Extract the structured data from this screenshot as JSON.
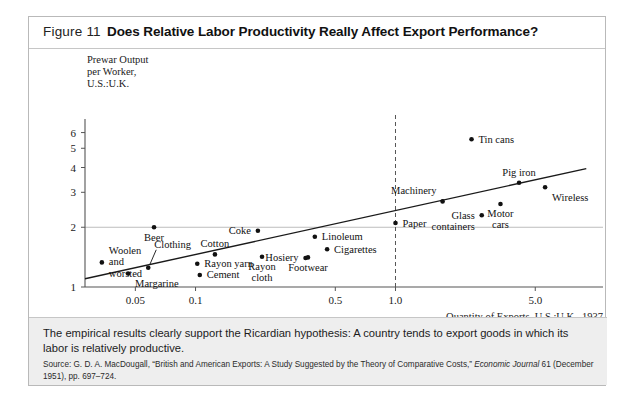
{
  "figure": {
    "number": "Figure 11",
    "title": "Does Relative Labor Productivity Really Affect Export Performance?",
    "caption": "The empirical results clearly support the Ricardian hypothesis: A country tends to export goods in which its labor is relatively productive.",
    "source_prefix": "Source: G. D. A. MacDougall, “British and American Exports: A Study Suggested by the Theory of Comparative Costs,” ",
    "source_italic": "Economic Journal",
    "source_suffix": " 61 (December 1951), pp. 697–724."
  },
  "chart_data": {
    "type": "scatter",
    "title": "Does Relative Labor Productivity Really Affect Export Performance?",
    "xlabel": "Quantity of Exports, U.S.:U.K., 1937",
    "ylabel": "Prewar Output per Worker, U.S.:U.K.",
    "ylabel_lines": [
      "Prewar Output",
      "per Worker,",
      "U.S.:U.K."
    ],
    "xscale": "log",
    "yscale": "log",
    "xticks": [
      "0.05",
      "0.1",
      "0.5",
      "1.0",
      "5.0"
    ],
    "xtick_values": [
      0.05,
      0.1,
      0.5,
      1.0,
      5.0
    ],
    "yticks": [
      "1",
      "2",
      "3",
      "4",
      "5",
      "6"
    ],
    "ytick_values": [
      1,
      2,
      3,
      4,
      5,
      6
    ],
    "xlim": [
      0.028,
      9.5
    ],
    "ylim": [
      1.0,
      6.4
    ],
    "grid": "single horizontal gridline at y=2",
    "gridline_y": 2,
    "reference_line_x": 1.0,
    "reference_line_style": "dashed vertical",
    "trend_line": {
      "x1": 0.028,
      "y1": 1.1,
      "x2": 9.0,
      "y2": 3.95,
      "style": "solid"
    },
    "points": [
      {
        "label": "Woolen and worsted",
        "x": 0.034,
        "y": 1.33,
        "label_lines": [
          "Woolen",
          "and",
          "worsted"
        ],
        "label_pos": "right"
      },
      {
        "label": "Margarine",
        "x": 0.046,
        "y": 1.17,
        "label_lines": [
          "Margarine"
        ],
        "label_pos": "below-right"
      },
      {
        "label": "Beer",
        "x": 0.062,
        "y": 2.0,
        "label_lines": [
          "Beer"
        ],
        "label_pos": "below"
      },
      {
        "label": "Clothing",
        "x": 0.058,
        "y": 1.25,
        "label_lines": [
          "Clothing"
        ],
        "label_pos": "leader-above"
      },
      {
        "label": "Cotton",
        "x": 0.125,
        "y": 1.46,
        "label_lines": [
          "Cotton"
        ],
        "label_pos": "above"
      },
      {
        "label": "Rayon yarn",
        "x": 0.102,
        "y": 1.31,
        "label_lines": [
          "Rayon yarn"
        ],
        "label_pos": "right"
      },
      {
        "label": "Cement",
        "x": 0.105,
        "y": 1.15,
        "label_lines": [
          "Cement"
        ],
        "label_pos": "right"
      },
      {
        "label": "Coke",
        "x": 0.205,
        "y": 1.92,
        "label_lines": [
          "Coke"
        ],
        "label_pos": "left"
      },
      {
        "label": "Rayon cloth",
        "x": 0.215,
        "y": 1.42,
        "label_lines": [
          "Rayon",
          "cloth"
        ],
        "label_pos": "below"
      },
      {
        "label": "Hosiery",
        "x": 0.355,
        "y": 1.4,
        "label_lines": [
          "Hosiery"
        ],
        "label_pos": "left"
      },
      {
        "label": "Linoleum",
        "x": 0.395,
        "y": 1.79,
        "label_lines": [
          "Linoleum"
        ],
        "label_pos": "right"
      },
      {
        "label": "Cigarettes",
        "x": 0.455,
        "y": 1.55,
        "label_lines": [
          "Cigarettes"
        ],
        "label_pos": "right"
      },
      {
        "label": "Footwear",
        "x": 0.365,
        "y": 1.41,
        "label_lines": [
          "Footwear"
        ],
        "label_pos": "below"
      },
      {
        "label": "Paper",
        "x": 1.0,
        "y": 2.1,
        "label_lines": [
          "Paper"
        ],
        "label_pos": "right"
      },
      {
        "label": "Machinery",
        "x": 1.72,
        "y": 2.7,
        "label_lines": [
          "Machinery"
        ],
        "label_pos": "above-left"
      },
      {
        "label": "Glass containers",
        "x": 2.7,
        "y": 2.3,
        "label_lines": [
          "Glass",
          "containers"
        ],
        "label_pos": "left"
      },
      {
        "label": "Tin cans",
        "x": 2.4,
        "y": 5.55,
        "label_lines": [
          "Tin cans"
        ],
        "label_pos": "right"
      },
      {
        "label": "Motor cars",
        "x": 3.35,
        "y": 2.62,
        "label_lines": [
          "Motor",
          "cars"
        ],
        "label_pos": "below"
      },
      {
        "label": "Pig iron",
        "x": 4.15,
        "y": 3.35,
        "label_lines": [
          "Pig iron"
        ],
        "label_pos": "above"
      },
      {
        "label": "Wireless",
        "x": 5.6,
        "y": 3.18,
        "label_lines": [
          "Wireless"
        ],
        "label_pos": "below-right"
      }
    ]
  }
}
